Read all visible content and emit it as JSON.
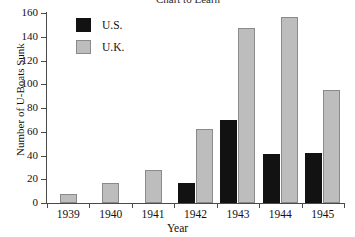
{
  "chart_data": {
    "type": "bar",
    "title": "Chart to Learn",
    "title_clipped": true,
    "xlabel": "Year",
    "ylabel": "Number of U-Boats Sunk",
    "categories": [
      "1939",
      "1940",
      "1941",
      "1942",
      "1943",
      "1944",
      "1945"
    ],
    "series": [
      {
        "name": "U.S.",
        "color": "#121212",
        "values": [
          0,
          0,
          0,
          17,
          70,
          41,
          42
        ]
      },
      {
        "name": "U.K.",
        "color": "#bdbdbd",
        "values": [
          8,
          17,
          28,
          62,
          147,
          157,
          95
        ]
      }
    ],
    "ylim": [
      0,
      160
    ],
    "yticks": [
      0,
      20,
      40,
      60,
      80,
      100,
      120,
      140,
      160
    ],
    "grid": false,
    "legend_position": "top-left"
  },
  "legend": {
    "items": [
      {
        "label": "U.S.",
        "swatch": "black-square-swatch"
      },
      {
        "label": "U.K.",
        "swatch": "gray-square-swatch"
      }
    ]
  }
}
